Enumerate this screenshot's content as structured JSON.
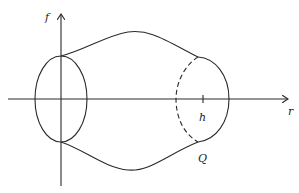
{
  "figure": {
    "labels": {
      "vertical_axis": "f",
      "horizontal_axis": "r",
      "tick_h": "h",
      "point_Q": "Q"
    },
    "line_color": "#2a2a2a",
    "background_color": "#ffffff"
  }
}
